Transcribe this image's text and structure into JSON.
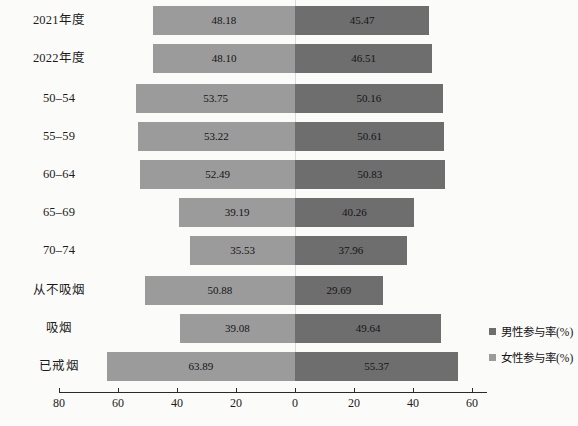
{
  "chart_data": {
    "type": "bar",
    "subtype": "diverging-horizontal-bar",
    "title": "",
    "xlabel": "",
    "ylabel": "",
    "grid": false,
    "legend_position": "right",
    "axis": {
      "tick_labels": [
        "80",
        "60",
        "40",
        "20",
        "0",
        "20",
        "40",
        "60"
      ],
      "tick_values": [
        -80,
        -60,
        -40,
        -20,
        0,
        20,
        40,
        60
      ],
      "xlim": [
        -80,
        60
      ],
      "zero_at": 0
    },
    "categories": [
      "2021年度",
      "2022年度",
      "50–54",
      "55–59",
      "60–64",
      "65–69",
      "70–74",
      "从不吸烟",
      "吸烟",
      "已戒烟"
    ],
    "series": [
      {
        "name": "女性参与率(%)",
        "side": "left",
        "color": "#9b9b9b",
        "values": [
          48.18,
          48.1,
          53.75,
          53.22,
          52.49,
          39.19,
          35.53,
          50.88,
          39.08,
          63.89
        ],
        "labels": [
          "48.18",
          "48.10",
          "53.75",
          "53.22",
          "52.49",
          "39.19",
          "35.53",
          "50.88",
          "39.08",
          "63.89"
        ]
      },
      {
        "name": "男性参与率(%)",
        "side": "right",
        "color": "#6e6e6e",
        "values": [
          45.47,
          46.51,
          50.16,
          50.61,
          50.83,
          40.26,
          37.96,
          29.69,
          49.64,
          55.37
        ],
        "labels": [
          "45.47",
          "46.51",
          "50.16",
          "50.61",
          "50.83",
          "40.26",
          "37.96",
          "29.69",
          "49.64",
          "55.37"
        ]
      }
    ]
  },
  "legend": {
    "items": [
      {
        "label": "男性参与率(%)",
        "swatch": "male"
      },
      {
        "label": "女性参与率(%)",
        "swatch": "female"
      }
    ]
  }
}
